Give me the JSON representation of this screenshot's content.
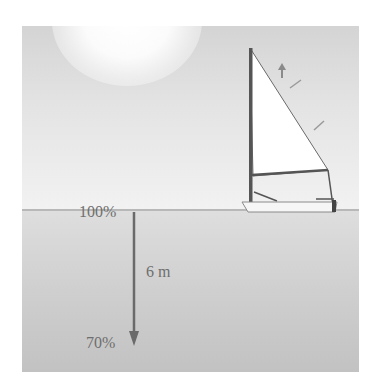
{
  "diagram": {
    "surface_label": "100%",
    "depth_label": "6 m",
    "bottom_label": "70%",
    "colors": {
      "sky_top": "#d4d4d4",
      "sky_bottom": "#f2f2f2",
      "water_top": "#dedede",
      "water_bottom": "#c2c2c2",
      "arrow": "#6a6a6a",
      "label_text": "#6e6e6e",
      "sail": "#ffffff",
      "mast": "#555555"
    },
    "icons": {
      "sun": "sun-glow-icon",
      "sailboat": "sailboat-icon",
      "depth_arrow": "down-arrow-icon"
    }
  }
}
